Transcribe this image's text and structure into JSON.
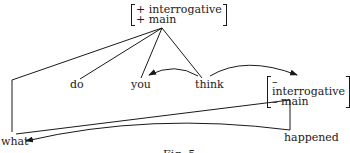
{
  "diagram": {
    "top_features": [
      "+ interrogative",
      "+ main"
    ],
    "embedded_features": [
      "– interrogative",
      "– main"
    ],
    "words": {
      "do": "do",
      "you": "you",
      "think": "think",
      "what": "what",
      "happened": "happened"
    },
    "caption": "Fig. 5"
  },
  "colors": {
    "line": "#1a1a1a",
    "background": "#ffffff"
  }
}
